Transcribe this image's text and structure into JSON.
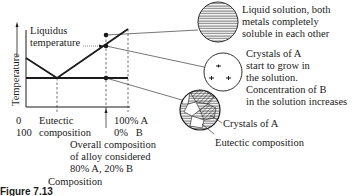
{
  "diagram": {
    "y_axis_label": "Temperature",
    "x_axis_label": "Composition",
    "liquidus_label_line1": "Liquidus",
    "liquidus_label_line2": "temperature",
    "x_left_top": "0",
    "x_left_bottom": "100",
    "eutectic_label_line1": "Eutectic",
    "eutectic_label_line2": "composition",
    "x_right_top": "100% A",
    "x_right_bottom": "0%   B",
    "alloy_line1": "Overall composition",
    "alloy_line2": "of alloy considered",
    "alloy_line3": "80% A, 20% B",
    "circle1_line1": "Liquid solution, both",
    "circle1_line2": "metals completely",
    "circle1_line3": "soluble in each other",
    "circle2_line1": "Crystals of A",
    "circle2_line2": "start to grow in",
    "circle2_line3": "the solution.",
    "circle2_line4": "Concentration of B",
    "circle2_line5": "in the solution increases",
    "circle3_label_a": "Crystals of A",
    "circle3_label_b": "Eutectic composition",
    "figure_caption": "Figure 7.13",
    "colors": {
      "ink": "#1a1a1a",
      "background": "#ffffff"
    }
  }
}
